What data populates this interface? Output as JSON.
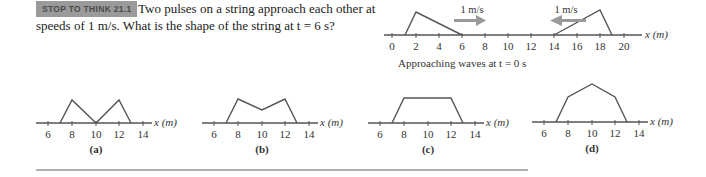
{
  "question": {
    "badge": "STOP TO THINK 21.1",
    "line1": "Two pulses on a string approach each other at",
    "line2": "speeds of 1 m/s. What is the shape of the string at t = 6 s?"
  },
  "main_figure": {
    "caption": "Approaching waves at t = 0 s",
    "axis_label": "x (m)",
    "ticks": [
      "0",
      "2",
      "4",
      "6",
      "8",
      "10",
      "12",
      "14",
      "16",
      "18",
      "20"
    ],
    "left_pulse": {
      "points_x": [
        1,
        2,
        6
      ],
      "speed_label": "1 m/s",
      "direction": "right"
    },
    "right_pulse": {
      "points_x": [
        14,
        18,
        19
      ],
      "speed_label": "1 m/s",
      "direction": "left"
    },
    "arrow_color": "#999999"
  },
  "answers": [
    {
      "label": "(a)",
      "axis_label": "x (m)",
      "ticks": [
        "6",
        "8",
        "10",
        "12",
        "14"
      ]
    },
    {
      "label": "(b)",
      "axis_label": "x (m)",
      "ticks": [
        "6",
        "8",
        "10",
        "12",
        "14"
      ]
    },
    {
      "label": "(c)",
      "axis_label": "x (m)",
      "ticks": [
        "6",
        "8",
        "10",
        "12",
        "14"
      ]
    },
    {
      "label": "(d)",
      "axis_label": "x (m)",
      "ticks": [
        "6",
        "8",
        "10",
        "12",
        "14"
      ]
    }
  ]
}
